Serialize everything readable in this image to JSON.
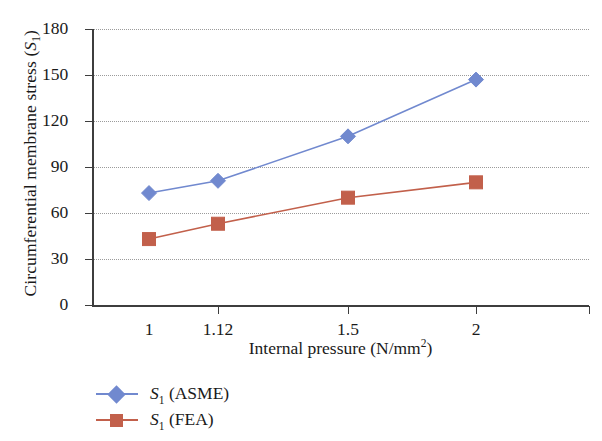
{
  "chart_data": {
    "type": "line",
    "title": "",
    "xlabel": "Internal pressure (N/mm2)",
    "xlabel_prefix": "Internal pressure (N/mm",
    "xlabel_exponent": "2",
    "xlabel_suffix": ")",
    "ylabel_prefix": "Circumferential membrane stress (",
    "ylabel_symbol": "S",
    "ylabel_subscript": "1",
    "ylabel_suffix": ")",
    "ylabel": "Circumferential membrane stress (S1)",
    "categories": [
      "1",
      "1.12",
      "1.5",
      "2"
    ],
    "x_tick_labels": [
      "1",
      "1.12",
      "1.5",
      "2"
    ],
    "y_tick_labels": [
      "0",
      "30",
      "60",
      "90",
      "120",
      "150",
      "180"
    ],
    "y_ticks": [
      0,
      30,
      60,
      90,
      120,
      150,
      180
    ],
    "ylim": [
      0,
      180
    ],
    "grid": "horizontal-dotted",
    "legend_position": "below-left",
    "series": [
      {
        "name": "S1 (ASME)",
        "name_symbol": "S",
        "name_subscript": "1",
        "name_suffix": "(ASME)",
        "marker": "diamond",
        "color": "#7189cf",
        "values": [
          73,
          81,
          110,
          147
        ]
      },
      {
        "name": "S1 (FEA)",
        "name_symbol": "S",
        "name_subscript": "1",
        "name_suffix": "(FEA)",
        "marker": "square",
        "color": "#c2604b",
        "values": [
          43,
          53,
          70,
          80
        ]
      }
    ]
  },
  "colors": {
    "asme": "#7189cf",
    "fea": "#c2604b",
    "axis": "#3d3d3d",
    "grid": "#9b9b9b",
    "background": "#ffffff"
  }
}
